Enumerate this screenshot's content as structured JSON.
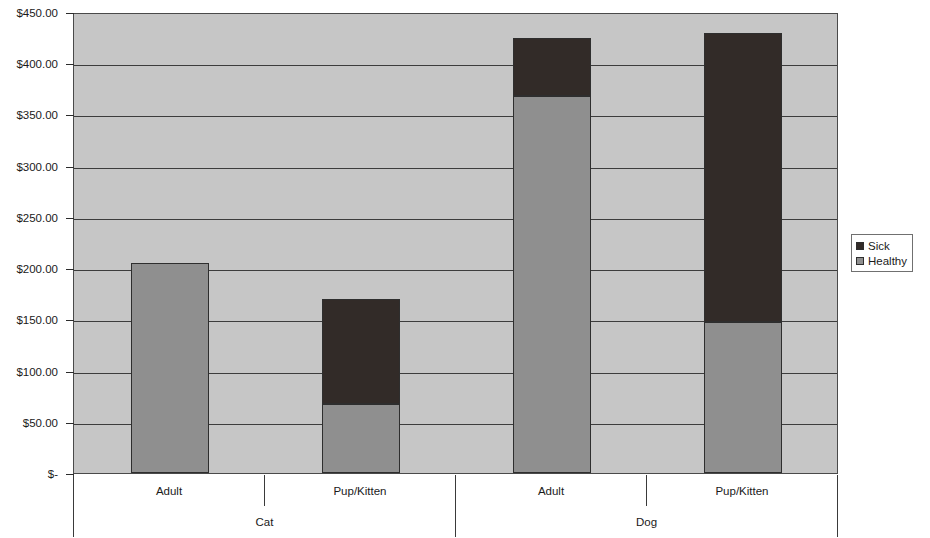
{
  "chart_data": {
    "type": "bar",
    "stacked": true,
    "title": "",
    "xlabel": "",
    "ylabel": "",
    "ylim": [
      0,
      450
    ],
    "grid": true,
    "legend_position": "right",
    "groups": [
      "Cat",
      "Dog"
    ],
    "categories": [
      "Adult",
      "Pup/Kitten",
      "Adult",
      "Pup/Kitten"
    ],
    "group_of_category": [
      "Cat",
      "Cat",
      "Dog",
      "Dog"
    ],
    "series": [
      {
        "name": "Sick",
        "color": "#322b28",
        "values": [
          0,
          103,
          57,
          283
        ]
      },
      {
        "name": "Healthy",
        "color": "#8f8f8f",
        "values": [
          205,
          67,
          368,
          147
        ]
      }
    ],
    "totals": [
      205,
      170,
      425,
      430
    ],
    "y_ticks": [
      {
        "value": 450,
        "label": "$450.00"
      },
      {
        "value": 400,
        "label": "$400.00"
      },
      {
        "value": 350,
        "label": "$350.00"
      },
      {
        "value": 300,
        "label": "$300.00"
      },
      {
        "value": 250,
        "label": "$250.00"
      },
      {
        "value": 200,
        "label": "$200.00"
      },
      {
        "value": 150,
        "label": "$150.00"
      },
      {
        "value": 100,
        "label": "$100.00"
      },
      {
        "value": 50,
        "label": "$50.00"
      },
      {
        "value": 0,
        "label": "$-"
      }
    ]
  },
  "legend": {
    "items": [
      {
        "label": "Sick",
        "color": "#322b28"
      },
      {
        "label": "Healthy",
        "color": "#8f8f8f"
      }
    ]
  },
  "axis": {
    "tick_labels": [
      "$450.00",
      "$400.00",
      "$350.00",
      "$300.00",
      "$250.00",
      "$200.00",
      "$150.00",
      "$100.00",
      "$50.00",
      "$-"
    ]
  },
  "category_labels": {
    "row1": [
      "Adult",
      "Pup/Kitten",
      "Adult",
      "Pup/Kitten"
    ],
    "row2": [
      "Cat",
      "Dog"
    ]
  },
  "colors": {
    "plot_background": "#c6c6c6",
    "sick": "#322b28",
    "healthy": "#8f8f8f",
    "gridline": "#3c3c3c",
    "axis": "#2b2b2b"
  }
}
